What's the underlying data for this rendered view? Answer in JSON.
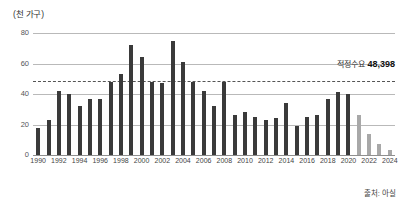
{
  "chart_data": {
    "type": "bar",
    "title": "",
    "unit_label": "(천 가구)",
    "xlabel": "",
    "ylabel": "",
    "ylim": [
      0,
      80
    ],
    "yticks": [
      0,
      20,
      40,
      60,
      80
    ],
    "grid": true,
    "legend": "none",
    "categories": [
      "1990",
      "1991",
      "1992",
      "1993",
      "1994",
      "1995",
      "1996",
      "1997",
      "1998",
      "1999",
      "2000",
      "2001",
      "2002",
      "2003",
      "2004",
      "2005",
      "2006",
      "2007",
      "2008",
      "2009",
      "2010",
      "2011",
      "2012",
      "2013",
      "2014",
      "2015",
      "2016",
      "2017",
      "2018",
      "2019",
      "2020",
      "2021",
      "2022",
      "2023",
      "2024"
    ],
    "values": [
      18,
      23,
      42,
      40,
      32,
      37,
      37,
      48,
      53,
      72,
      64,
      48,
      47,
      75,
      61,
      48,
      42,
      32,
      48,
      26,
      28,
      25,
      23,
      24,
      34,
      19,
      25,
      26,
      37,
      41,
      40,
      26,
      14,
      7,
      3
    ],
    "projected_from": "2021",
    "xtick_labels": [
      "1990",
      "1992",
      "1994",
      "1996",
      "1998",
      "2000",
      "2002",
      "2004",
      "2006",
      "2008",
      "2010",
      "2012",
      "2014",
      "2016",
      "2018",
      "2020",
      "2022",
      "2024"
    ],
    "threshold": {
      "label": "적정수요",
      "value_text": "48,398",
      "value": 48.398,
      "style": "dashed"
    },
    "source": "출처: 아실",
    "colors": {
      "bar": "#3a3a3a",
      "bar_projected": "#a8a8a8",
      "gridline": "#b9b9b9",
      "threshold": "#555555",
      "text": "#333333"
    }
  }
}
